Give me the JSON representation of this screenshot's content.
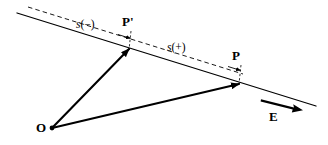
{
  "figure": {
    "type": "geometry-diagram",
    "background_color": "#ffffff",
    "stroke_color": "#000000",
    "labels": {
      "p_prime": "P'",
      "p": "P",
      "origin": "O",
      "field": "E",
      "s_negative_prefix": "s",
      "s_negative": "s(−)",
      "s_negative_arg": "(−)",
      "s_positive_prefix": "s",
      "s_positive": "s(+)",
      "s_positive_arg": "(+)"
    },
    "geometry": {
      "solid_line": {
        "x1": 17,
        "y1": 13,
        "x2": 316,
        "y2": 106
      },
      "dashed_line": {
        "x1": 28,
        "y1": 7,
        "x2": 243,
        "y2": 74
      },
      "origin_point": {
        "x": 52,
        "y": 128
      },
      "point_p_prime": {
        "x": 129,
        "y": 48
      },
      "point_p": {
        "x": 239,
        "y": 83
      },
      "vector_o_to_p_prime": {
        "x1": 52,
        "y1": 128,
        "x2": 129,
        "y2": 48
      },
      "vector_o_to_p": {
        "x1": 52,
        "y1": 128,
        "x2": 239,
        "y2": 83
      },
      "field_arrow": {
        "x1": 261,
        "y1": 100,
        "x2": 302,
        "y2": 111
      },
      "tick_p_prime": {
        "x1": 131,
        "y1": 32,
        "x2": 129,
        "y2": 49
      },
      "tick_p": {
        "x1": 241,
        "y1": 66,
        "x2": 239,
        "y2": 84
      }
    }
  }
}
